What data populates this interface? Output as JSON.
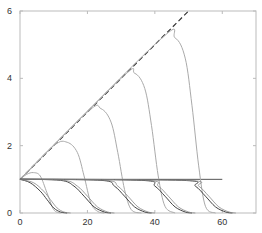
{
  "chart_data": {
    "type": "line",
    "title": "",
    "xlabel": "",
    "ylabel": "",
    "xlim": [
      0,
      70
    ],
    "ylim": [
      0,
      6
    ],
    "grid": false,
    "legend": null,
    "x_ticks": [
      0,
      20,
      40,
      60
    ],
    "y_ticks": [
      0,
      2,
      4,
      6
    ],
    "x_tick_labels": [
      "0",
      "20",
      "40",
      "60"
    ],
    "y_tick_labels": [
      "0",
      "2",
      "4",
      "6"
    ],
    "series": [
      {
        "name": "envelope (dashed)",
        "style": "dashed",
        "color": "#333333",
        "x": [
          0,
          50
        ],
        "y": [
          1,
          6
        ]
      },
      {
        "name": "baseline",
        "style": "solid",
        "color": "#555555",
        "x": [
          0,
          60
        ],
        "y": [
          1,
          1
        ]
      },
      {
        "name": "growth pulse 1",
        "style": "solid",
        "color": "#aaaaaa",
        "x": [
          0,
          2,
          4,
          6,
          8,
          10,
          12
        ],
        "y": [
          1,
          1.15,
          1.2,
          1.1,
          0.6,
          0.1,
          0
        ]
      },
      {
        "name": "growth pulse 2",
        "style": "solid",
        "color": "#aaaaaa",
        "x": [
          0,
          10,
          14,
          17,
          19,
          21,
          23,
          25
        ],
        "y": [
          1,
          2.0,
          2.1,
          1.8,
          1.1,
          0.3,
          0.05,
          0
        ]
      },
      {
        "name": "growth pulse 3",
        "style": "solid",
        "color": "#aaaaaa",
        "x": [
          0,
          20,
          24,
          27,
          29,
          31,
          33,
          36
        ],
        "y": [
          1,
          3.0,
          3.1,
          2.7,
          1.8,
          0.7,
          0.1,
          0
        ]
      },
      {
        "name": "growth pulse 4",
        "style": "solid",
        "color": "#aaaaaa",
        "x": [
          0,
          30,
          34,
          37,
          39,
          41,
          43,
          46
        ],
        "y": [
          1,
          4.0,
          4.15,
          3.7,
          2.6,
          1.1,
          0.2,
          0
        ]
      },
      {
        "name": "growth pulse 5",
        "style": "solid",
        "color": "#aaaaaa",
        "x": [
          0,
          41,
          46,
          49,
          51,
          53,
          55,
          58
        ],
        "y": [
          1,
          5.1,
          5.2,
          4.6,
          3.2,
          1.4,
          0.2,
          0
        ]
      },
      {
        "name": "decay 1",
        "style": "solid",
        "color": "#444444",
        "x": [
          0,
          3,
          6,
          8,
          10,
          12,
          14
        ],
        "y": [
          1,
          0.9,
          0.65,
          0.4,
          0.15,
          0.03,
          0
        ]
      },
      {
        "name": "decay 2",
        "style": "solid",
        "color": "#444444",
        "x": [
          0,
          12,
          16,
          19,
          22,
          25,
          27
        ],
        "y": [
          1,
          0.97,
          0.8,
          0.5,
          0.18,
          0.03,
          0
        ]
      },
      {
        "name": "decay 3",
        "style": "solid",
        "color": "#444444",
        "x": [
          0,
          24,
          28,
          31,
          34,
          37,
          39
        ],
        "y": [
          1,
          0.97,
          0.8,
          0.5,
          0.18,
          0.03,
          0
        ]
      },
      {
        "name": "decay 4",
        "style": "solid",
        "color": "#444444",
        "x": [
          0,
          36,
          40,
          43,
          46,
          49,
          51
        ],
        "y": [
          1,
          0.97,
          0.8,
          0.5,
          0.18,
          0.03,
          0
        ]
      },
      {
        "name": "decay 5",
        "style": "solid",
        "color": "#444444",
        "x": [
          0,
          48,
          52,
          55,
          58,
          61,
          63
        ],
        "y": [
          1,
          0.97,
          0.8,
          0.5,
          0.18,
          0.03,
          0
        ]
      }
    ]
  },
  "colors": {
    "axis": "#bbbbbb",
    "background": "#ffffff",
    "text": "#333333"
  }
}
